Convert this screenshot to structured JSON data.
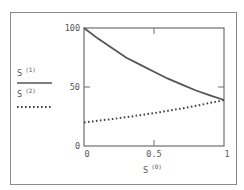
{
  "chart_data": {
    "type": "line",
    "title": "",
    "xlabel": "S",
    "xlabel_superscript": "(0)",
    "ylabel": "",
    "xlim": [
      0,
      1
    ],
    "ylim": [
      0,
      100
    ],
    "x_ticks": [
      "0",
      "0.5",
      "1"
    ],
    "y_ticks": [
      "0",
      "50",
      "100"
    ],
    "grid": false,
    "legend_position": "left",
    "x": [
      0,
      0.1,
      0.2,
      0.3,
      0.4,
      0.5,
      0.6,
      0.7,
      0.8,
      0.9,
      1.0
    ],
    "series": [
      {
        "name": "S",
        "superscript": "(1)",
        "style": "solid",
        "color": "#555555",
        "values": [
          100,
          91,
          83,
          75,
          69,
          63,
          57,
          52,
          47,
          43,
          39
        ]
      },
      {
        "name": "S",
        "superscript": "(2)",
        "style": "dotted",
        "color": "#444444",
        "values": [
          20,
          21.4,
          22.8,
          24.4,
          26.1,
          27.9,
          29.8,
          31.9,
          34.1,
          36.5,
          39
        ]
      }
    ]
  },
  "legend": {
    "items": [
      {
        "label": "S",
        "sup": "(1)"
      },
      {
        "label": "S",
        "sup": "(2)"
      }
    ]
  },
  "axes": {
    "x_label": "S",
    "x_label_sup": "(0)",
    "x_tick_labels": [
      "0",
      "0.5",
      "1"
    ],
    "y_tick_labels": [
      "100",
      "50",
      "0"
    ]
  }
}
